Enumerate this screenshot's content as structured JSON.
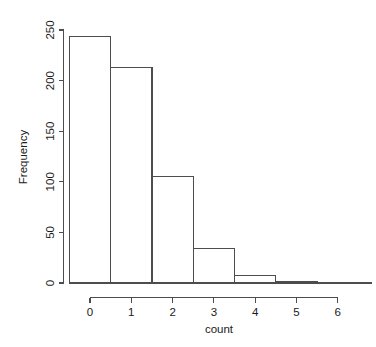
{
  "chart_data": {
    "type": "bar",
    "title": "",
    "subtitle": "",
    "xlabel": "count",
    "ylabel": "Frequency",
    "categories": [
      "0",
      "1",
      "2",
      "3",
      "4",
      "5"
    ],
    "bin_edges": [
      0,
      1,
      2,
      3,
      4,
      5,
      6
    ],
    "bin_centers": [
      0,
      1,
      2,
      3,
      4,
      5
    ],
    "values": [
      244,
      213,
      105,
      34,
      7,
      1
    ],
    "bars": [
      {
        "label": "0",
        "left": -0.5,
        "right": 0.5,
        "value": 244
      },
      {
        "label": "1",
        "left": 0.5,
        "right": 1.5,
        "value": 213
      },
      {
        "label": "2",
        "left": 1.5,
        "right": 2.5,
        "value": 105
      },
      {
        "label": "3",
        "left": 2.5,
        "right": 3.5,
        "value": 34
      },
      {
        "label": "4",
        "left": 3.5,
        "right": 4.5,
        "value": 7
      },
      {
        "label": "5",
        "left": 4.5,
        "right": 5.5,
        "value": 1
      }
    ],
    "xlim": [
      -0.5,
      6.2
    ],
    "ylim": [
      0,
      250
    ],
    "x_ticks": [
      0,
      1,
      2,
      3,
      4,
      5,
      6
    ],
    "x_tick_labels": [
      "0",
      "1",
      "2",
      "3",
      "4",
      "5",
      "6"
    ],
    "y_ticks": [
      0,
      50,
      100,
      150,
      200,
      250
    ],
    "y_tick_labels": [
      "0",
      "50",
      "100",
      "150",
      "200",
      "250"
    ],
    "grid": false,
    "legend": false,
    "legend_position": "none",
    "bar_fill": "none",
    "bar_stroke": "#4d4d4d",
    "axis_color": "#4d4d4d",
    "text_color": "#1a1a1a",
    "background": "#ffffff"
  },
  "axes": {
    "y_title": "Frequency",
    "x_title": "count"
  }
}
